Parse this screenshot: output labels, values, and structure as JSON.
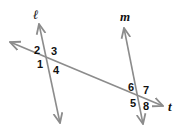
{
  "diagram": {
    "type": "parallel lines cut by a transversal",
    "colors": {
      "line": "#8c8c8c",
      "text": "#111111",
      "background": "#ffffff"
    },
    "lines": [
      {
        "id": "l",
        "label": "ℓ"
      },
      {
        "id": "m",
        "label": "m"
      },
      {
        "id": "t",
        "label": "t"
      }
    ],
    "angles": {
      "a1": "1",
      "a2": "2",
      "a3": "3",
      "a4": "4",
      "a5": "5",
      "a6": "6",
      "a7": "7",
      "a8": "8"
    }
  }
}
